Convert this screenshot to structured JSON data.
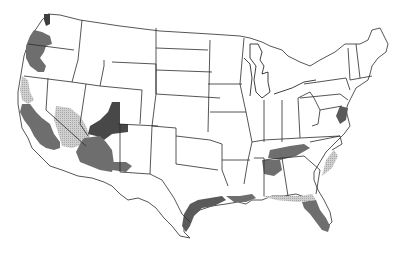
{
  "map": {
    "title": "",
    "subject": "Contiguous United States",
    "legend_visible": false,
    "shading_levels": [
      {
        "id": "light",
        "description": "light stippled gray",
        "color": "#c4c4c4"
      },
      {
        "id": "medium",
        "description": "medium gray",
        "color": "#6e6e6e"
      },
      {
        "id": "dark",
        "description": "dark gray",
        "color": "#4a4a4a"
      }
    ],
    "shaded_regions": [
      {
        "name": "Washington coast (Puget Sound)",
        "level": "dark"
      },
      {
        "name": "Oregon coast and western valleys",
        "level": "medium"
      },
      {
        "name": "Northern California coast",
        "level": "light"
      },
      {
        "name": "Central/Southern California",
        "level": "medium"
      },
      {
        "name": "Southern Nevada / Eastern California desert",
        "level": "light"
      },
      {
        "name": "Southern Utah",
        "level": "dark"
      },
      {
        "name": "Arizona",
        "level": "medium"
      },
      {
        "name": "Northern Arizona",
        "level": "dark"
      },
      {
        "name": "New Mexico (central patch)",
        "level": "medium"
      },
      {
        "name": "Texas Gulf coast",
        "level": "medium"
      },
      {
        "name": "Louisiana/Mississippi Gulf coast",
        "level": "medium"
      },
      {
        "name": "Tennessee / Kentucky patches",
        "level": "medium"
      },
      {
        "name": "Northern Alabama",
        "level": "medium"
      },
      {
        "name": "Carolina coast",
        "level": "light"
      },
      {
        "name": "Georgia / Florida panhandle coast",
        "level": "light"
      },
      {
        "name": "Florida peninsula",
        "level": "medium"
      },
      {
        "name": "Chesapeake / Mid-Atlantic coast",
        "level": "medium"
      }
    ]
  }
}
